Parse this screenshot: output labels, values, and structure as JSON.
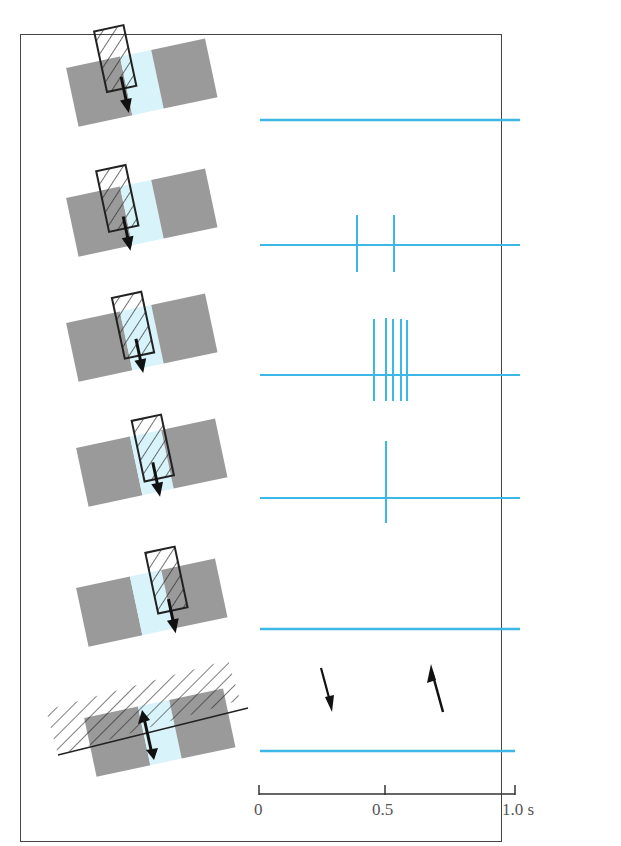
{
  "figure": {
    "colors": {
      "trace": "#3cb8e6",
      "field": "#9a9a9a",
      "center": "#d8f3fa",
      "ink": "#222222"
    }
  },
  "rows": [
    {
      "id": 1,
      "stimulus_position": "entering center, moving down",
      "spikes_s": []
    },
    {
      "id": 2,
      "stimulus_position": "partly over center",
      "spikes_s": [
        0.39,
        0.53
      ]
    },
    {
      "id": 3,
      "stimulus_position": "over center",
      "spikes_s": [
        0.45,
        0.48,
        0.5,
        0.53,
        0.55
      ]
    },
    {
      "id": 4,
      "stimulus_position": "leaving center",
      "spikes_s": [
        0.5
      ]
    },
    {
      "id": 5,
      "stimulus_position": "beyond center",
      "spikes_s": []
    },
    {
      "id": 6,
      "stimulus_position": "large field moving both directions",
      "spikes_s": [],
      "arrows": [
        "down",
        "up"
      ]
    }
  ],
  "axis": {
    "ticks": [
      "0",
      "0.5",
      "1.0 s"
    ],
    "range_s": [
      0,
      1.0
    ]
  }
}
